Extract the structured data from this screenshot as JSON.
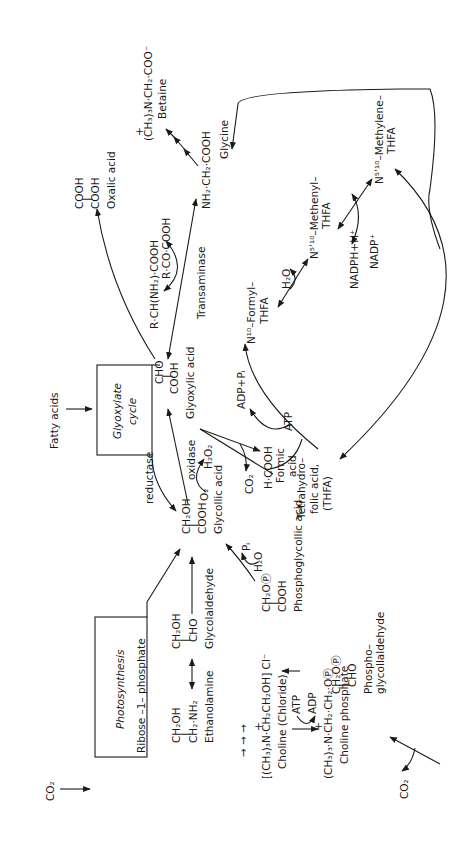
{
  "diagram": {
    "boxes": {
      "photosynthesis": "Photosynthesis",
      "glyoxylate_cycle_1": "Glyoxylate",
      "glyoxylate_cycle_2": "cycle"
    },
    "inputs": {
      "co2_top": "CO₂",
      "fatty_acids": "Fatty acids"
    },
    "compounds": {
      "ribose": "Ribose –1– phosphate",
      "glycollic_1": "CH₂OH",
      "glycollic_2": "COOH",
      "glycollic_name": "Glycollic acid",
      "glyoxylic_1": "CHO",
      "glyoxylic_2": "COOH",
      "glyoxylic_name": "Glyoxylic acid",
      "oxalic_1": "COOH",
      "oxalic_2": "COOH",
      "oxalic_name": "Oxalic acid",
      "glycine_formula": "NH₂·CH₂·COOH",
      "glycine_name": "Glycine",
      "betaine_formula": "(CH₃)₃N·CH₂·COO⁻",
      "betaine_plus": "+",
      "betaine_name": "Betaine",
      "amino_acid": "R·CH(NH₂)·COOH",
      "keto_acid": "R·CO·COOH",
      "glycolaldehyde_1": "CH₂OH",
      "glycolaldehyde_2": "CHO",
      "glycolaldehyde_name": "Glycolaldehyde",
      "ethanolamine_1": "CH₂OH",
      "ethanolamine_2": "CH₂·NH₂",
      "ethanolamine_name": "Ethanolamine",
      "phosphoglycollic_1": "CH₂OⓅ",
      "phosphoglycollic_2": "COOH",
      "phosphoglycollic_name": "Phosphoglycollic acid",
      "phosphoglycolaldehyde_1": "CH₂OⓅ",
      "phosphoglycolaldehyde_2": "CHO",
      "phosphoglycolaldehyde_name_1": "Phospho–",
      "phosphoglycolaldehyde_name_2": "glycollaldehyde",
      "choline_chloride_formula": "[(CH₃)₃N·CH₂CH₂OH] Cl⁻",
      "choline_chloride_plus": "+",
      "choline_chloride_name": "Choline (Chloride)",
      "choline_phosphate_formula": "(CH₃)₃·N·CH₂·CH₂·OⓅ",
      "choline_phosphate_plus": "+",
      "choline_phosphate_name": "Choline phosphate",
      "formic_1": "H·COOH",
      "formic_2": "Formic",
      "formic_3": "acid",
      "thfa_1": "Tetrahydro–",
      "thfa_2": "folic acid,",
      "thfa_3": "(THFA)",
      "formyl_1": "N¹⁰–Formyl–",
      "formyl_2": "THFA",
      "methenyl_1": "N⁵ʹ¹⁰–Methenyl–",
      "methenyl_2": "THFA",
      "methylene_1": "N⁵ʹ¹⁰–Methylene–",
      "methylene_2": "THFA"
    },
    "cofactors": {
      "h2o2": "H₂O₂",
      "o2": "O₂",
      "co2_formic": "CO₂",
      "co2_bottom": "CO₂",
      "pi": "Pᵢ",
      "h2o_phospho": "H₂O",
      "atp_choline": "ATP",
      "adp_choline": "ADP",
      "atp_thfa": "ATP",
      "adp_pi": "ADP+Pᵢ",
      "h2o_thfa": "H₂O",
      "nadph": "NADPH+H⁺",
      "nadp": "NADP⁺"
    },
    "enzymes": {
      "reductase": "reductase",
      "oxidase": "oxidase",
      "transaminase": "Transaminase"
    },
    "multi_step_arrows": "→ → →"
  }
}
